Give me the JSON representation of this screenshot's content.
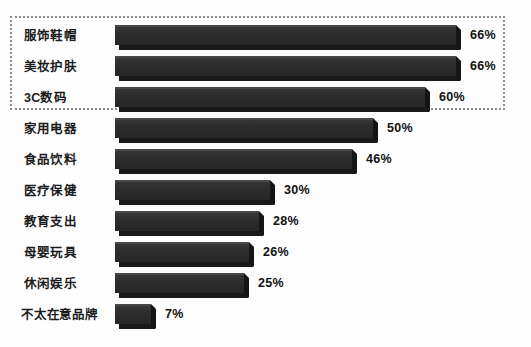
{
  "chart": {
    "type": "bar",
    "orientation": "horizontal",
    "highlight_box": {
      "present": true,
      "style": "dotted",
      "covers_rows": [
        "服饰鞋帽",
        "美妆护肤",
        "3C数码"
      ]
    },
    "colors": {
      "background": "#fdfdfd",
      "bar_face": "#2e2e2e",
      "bar_top_bevel": "#474747",
      "bar_shadow": "#191919",
      "label_text": "#1c1c1c",
      "value_text": "#111111",
      "highlight_border": "#8d8d8d"
    }
  },
  "chart_data": {
    "type": "bar",
    "title": "",
    "xlabel": "",
    "ylabel": "",
    "grid": false,
    "legend": "none",
    "orientation": "horizontal",
    "value_suffix": "%",
    "xlim": [
      0,
      70
    ],
    "categories": [
      "服饰鞋帽",
      "美妆护肤",
      "3C数码",
      "家用电器",
      "食品饮料",
      "医疗保健",
      "教育支出",
      "母婴玩具",
      "休闲娱乐",
      "不太在意品牌"
    ],
    "values": [
      66,
      66,
      60,
      50,
      46,
      30,
      28,
      26,
      25,
      7
    ],
    "value_labels": [
      "66%",
      "66%",
      "60%",
      "50%",
      "46%",
      "30%",
      "28%",
      "26%",
      "25%",
      "7%"
    ],
    "rows": [
      {
        "label": "服饰鞋帽",
        "value": 66,
        "value_label": "66%",
        "highlighted": true
      },
      {
        "label": "美妆护肤",
        "value": 66,
        "value_label": "66%",
        "highlighted": true
      },
      {
        "label": "3C数码",
        "value": 60,
        "value_label": "60%",
        "highlighted": true
      },
      {
        "label": "家用电器",
        "value": 50,
        "value_label": "50%",
        "highlighted": false
      },
      {
        "label": "食品饮料",
        "value": 46,
        "value_label": "46%",
        "highlighted": false
      },
      {
        "label": "医疗保健",
        "value": 30,
        "value_label": "30%",
        "highlighted": false
      },
      {
        "label": "教育支出",
        "value": 28,
        "value_label": "28%",
        "highlighted": false
      },
      {
        "label": "母婴玩具",
        "value": 26,
        "value_label": "26%",
        "highlighted": false
      },
      {
        "label": "休闲娱乐",
        "value": 25,
        "value_label": "25%",
        "highlighted": false
      },
      {
        "label": "不太在意品牌",
        "value": 7,
        "value_label": "7%",
        "highlighted": false
      }
    ]
  }
}
